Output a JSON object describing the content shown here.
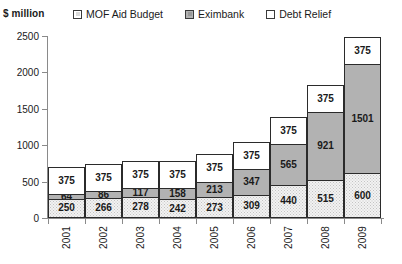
{
  "unit_label": "$ million",
  "legend": {
    "position": "top",
    "items": [
      {
        "label": "MOF Aid Budget",
        "icon": "legend-swatch-mof",
        "color": "#ffffff"
      },
      {
        "label": "Eximbank",
        "icon": "legend-swatch-eximbank",
        "color": "#b2b2b2"
      },
      {
        "label": "Debt Relief",
        "icon": "legend-swatch-debt-relief",
        "color": "#f2f2f2"
      }
    ]
  },
  "chart_data": {
    "type": "bar",
    "stacked": true,
    "title": "",
    "subtitle": "",
    "xlabel": "",
    "ylabel": "$ million",
    "ylim": [
      0,
      2500
    ],
    "ytick_labels": [
      "2500",
      "2000",
      "1500",
      "1000",
      "500",
      "0"
    ],
    "yticks": [
      2500,
      2000,
      1500,
      1000,
      500,
      0
    ],
    "grid": false,
    "legend_position": "top",
    "categories": [
      "2001",
      "2002",
      "2003",
      "2004",
      "2005",
      "2006",
      "2007",
      "2008",
      "2009"
    ],
    "series": [
      {
        "name": "Debt Relief",
        "color": "#f2f2f2",
        "values": [
          250,
          266,
          278,
          242,
          273,
          309,
          440,
          515,
          600
        ]
      },
      {
        "name": "Eximbank",
        "color": "#b2b2b2",
        "values": [
          64,
          86,
          117,
          158,
          213,
          347,
          565,
          921,
          1501
        ]
      },
      {
        "name": "MOF Aid Budget",
        "color": "#ffffff",
        "values": [
          375,
          375,
          375,
          375,
          375,
          375,
          375,
          375,
          375
        ]
      }
    ],
    "totals": [
      689,
      727,
      770,
      775,
      861,
      1031,
      1380,
      1811,
      2476
    ],
    "data_labels": {
      "2001": {
        "debt_relief": "250",
        "eximbank": "64",
        "mof_aid_budget": "375"
      },
      "2002": {
        "debt_relief": "266",
        "eximbank": "86",
        "mof_aid_budget": "375"
      },
      "2003": {
        "debt_relief": "278",
        "eximbank": "117",
        "mof_aid_budget": "375"
      },
      "2004": {
        "debt_relief": "242",
        "eximbank": "158",
        "mof_aid_budget": "375"
      },
      "2005": {
        "debt_relief": "273",
        "eximbank": "213",
        "mof_aid_budget": "375"
      },
      "2006": {
        "debt_relief": "309",
        "eximbank": "347",
        "mof_aid_budget": "375"
      },
      "2007": {
        "debt_relief": "440",
        "eximbank": "565",
        "mof_aid_budget": "375"
      },
      "2008": {
        "debt_relief": "515",
        "eximbank": "921",
        "mof_aid_budget": "375"
      },
      "2009": {
        "debt_relief": "600",
        "eximbank": "1501",
        "mof_aid_budget": "375"
      }
    }
  }
}
